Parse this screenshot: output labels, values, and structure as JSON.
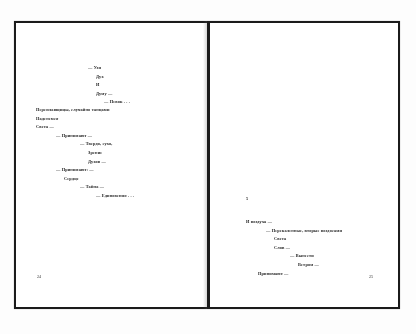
{
  "document": {
    "kind": "book-spread-scan",
    "language": "ru",
    "background_color": "#fdfdfd",
    "frame_color": "#1b1b1b",
    "text_color": "#1f1f1f"
  },
  "left_page": {
    "folio": "24",
    "stanzas": [
      {
        "name": "stanza-upper",
        "lines": [
          {
            "indent": 6,
            "text": "— Узи"
          },
          {
            "indent": 7,
            "text": "Дух"
          },
          {
            "indent": 7,
            "text": "И"
          },
          {
            "indent": 7,
            "text": "Думу —"
          },
          {
            "indent": 8,
            "text": "— Певок . . ."
          }
        ]
      },
      {
        "name": "stanza-middle",
        "lines": [
          {
            "indent": 0,
            "text": "Переплавщицы, случайно танцами"
          },
          {
            "indent": 0,
            "text": "Наденемся"
          },
          {
            "indent": 0,
            "text": "Света —"
          },
          {
            "indent": 2,
            "text": "— Принимают —"
          },
          {
            "indent": 5,
            "text": "— Твердо, сухо,"
          },
          {
            "indent": 6,
            "text": "Зрение"
          },
          {
            "indent": 6,
            "text": "Духов —"
          },
          {
            "indent": 2,
            "text": "— Принимают: —"
          },
          {
            "indent": 3,
            "text": "Сердце"
          },
          {
            "indent": 5,
            "text": "— Тайна —"
          },
          {
            "indent": 7,
            "text": "— Единовения . . ."
          }
        ]
      }
    ]
  },
  "right_page": {
    "folio": "25",
    "section_number": "5",
    "stanzas": [
      {
        "name": "stanza-lower",
        "lines": [
          {
            "indent": 0,
            "text": "И воздуха —"
          },
          {
            "indent": 2,
            "text": "— Перекаленные, вторые воздосами"
          },
          {
            "indent": 3,
            "text": "Света"
          },
          {
            "indent": 3,
            "text": "Слов —"
          },
          {
            "indent": 5,
            "text": "— Вынести"
          },
          {
            "indent": 6,
            "text": "Ветром —"
          },
          {
            "indent": 1,
            "text": "Принимают —"
          }
        ]
      }
    ]
  }
}
